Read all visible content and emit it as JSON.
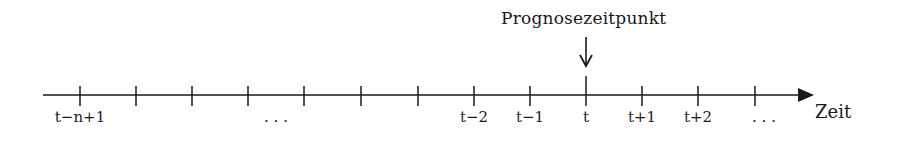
{
  "diagram": {
    "title": "Prognosezeitpunkt",
    "axis_label": "Zeit",
    "axis": {
      "x_start": 43,
      "x_end": 813,
      "y": 95,
      "color": "#1a1a1a"
    },
    "ticks": [
      {
        "x": 80,
        "label": "t−n+1"
      },
      {
        "x": 136,
        "label": ""
      },
      {
        "x": 192,
        "label": ""
      },
      {
        "x": 248,
        "label": "…"
      },
      {
        "x": 304,
        "label": ""
      },
      {
        "x": 361,
        "label": ""
      },
      {
        "x": 418,
        "label": ""
      },
      {
        "x": 474,
        "label": "t−2"
      },
      {
        "x": 530,
        "label": "t−1"
      },
      {
        "x": 586,
        "label": "t",
        "highlight": true
      },
      {
        "x": 642,
        "label": "t+1"
      },
      {
        "x": 698,
        "label": "t+2"
      },
      {
        "x": 755,
        "label": "…"
      }
    ],
    "labels": {
      "t_n_1": "t−n+1",
      "dots_left": ". . .",
      "t_2": "t−2",
      "t_1": "t−1",
      "t": "t",
      "t_p1": "t+1",
      "t_p2": "t+2",
      "dots_right": ". . ."
    },
    "marker": {
      "x": 586,
      "arrow_from_y": 37,
      "arrow_to_y": 66
    }
  }
}
